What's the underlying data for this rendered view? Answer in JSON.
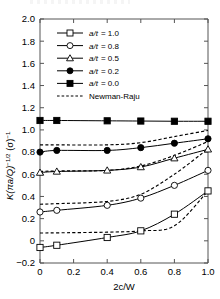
{
  "chart_data": {
    "type": "line",
    "title": "",
    "xlabel": "2c/W",
    "ylabel": "K(πa/Q)^-1/2 (σ)^-1",
    "xlim": [
      0,
      1.0
    ],
    "ylim": [
      -0.2,
      2.0
    ],
    "xticks": [
      "0",
      "0.2",
      "0.4",
      "0.6",
      "0.8",
      "1.0"
    ],
    "xtick_values": [
      0,
      0.2,
      0.4,
      0.6,
      0.8,
      1.0
    ],
    "yticks": [
      "-0.2",
      "0",
      "0.2",
      "0.4",
      "0.6",
      "0.8",
      "1.0",
      "1.2",
      "1.4",
      "1.6",
      "1.8",
      "2.0"
    ],
    "ytick_values": [
      -0.2,
      0,
      0.2,
      0.4,
      0.6,
      0.8,
      1.0,
      1.2,
      1.4,
      1.6,
      1.8,
      2.0
    ],
    "grid": false,
    "legend_position": "upper-left",
    "x": [
      0,
      0.1,
      0.4,
      0.6,
      0.8,
      1.0
    ],
    "series": [
      {
        "name": "a/t = 1.0",
        "marker": "open-square",
        "line": "solid",
        "values": [
          -0.06,
          -0.04,
          0.03,
          0.09,
          0.24,
          0.45
        ]
      },
      {
        "name": "a/t = 0.8",
        "marker": "open-circle",
        "line": "solid",
        "values": [
          0.26,
          0.275,
          0.32,
          0.385,
          0.5,
          0.635
        ]
      },
      {
        "name": "a/t = 0.5",
        "marker": "open-triangle",
        "line": "solid",
        "values": [
          0.615,
          0.625,
          0.635,
          0.665,
          0.745,
          0.825
        ]
      },
      {
        "name": "a/t = 0.2",
        "marker": "filled-circle",
        "line": "solid",
        "values": [
          0.8,
          0.815,
          0.815,
          0.84,
          0.88,
          0.92
        ]
      },
      {
        "name": "a/t = 0.0",
        "marker": "filled-square",
        "line": "solid",
        "values": [
          1.085,
          1.085,
          1.082,
          1.08,
          1.078,
          1.078
        ]
      },
      {
        "name": "Newman-Raju (a/t = 1.0)",
        "marker": "none",
        "line": "dashed",
        "values": [
          0.07,
          0.072,
          0.078,
          0.09,
          0.135,
          0.45
        ]
      },
      {
        "name": "Newman-Raju (a/t = 0.8)",
        "marker": "none",
        "line": "dashed",
        "values": [
          0.33,
          0.335,
          0.355,
          0.42,
          0.6,
          0.83
        ]
      },
      {
        "name": "Newman-Raju (a/t = 0.5)",
        "marker": "none",
        "line": "dashed",
        "values": [
          0.625,
          0.63,
          0.635,
          0.675,
          0.77,
          0.895
        ]
      },
      {
        "name": "Newman-Raju (a/t = 0.2)",
        "marker": "none",
        "line": "dashed",
        "values": [
          0.865,
          0.865,
          0.865,
          0.885,
          0.94,
          0.995
        ]
      }
    ]
  },
  "legend": {
    "items": [
      {
        "label_sym": "a/t",
        "label_eq": "= 1.0",
        "marker": "open-square",
        "line": "solid"
      },
      {
        "label_sym": "a/t",
        "label_eq": "= 0.8",
        "marker": "open-circle",
        "line": "solid"
      },
      {
        "label_sym": "a/t",
        "label_eq": "= 0.5",
        "marker": "open-triangle",
        "line": "solid"
      },
      {
        "label_sym": "a/t",
        "label_eq": "= 0.2",
        "marker": "filled-circle",
        "line": "solid"
      },
      {
        "label_sym": "a/t",
        "label_eq": "= 0.0",
        "marker": "filled-square",
        "line": "solid"
      },
      {
        "label_sym": "",
        "label_eq": "Newman-Raju",
        "marker": "none",
        "line": "dashed"
      }
    ]
  },
  "axes": {
    "x_title": "2c/W",
    "y_title_main": "K(πa/Q)",
    "y_title_exp1": "−1/2",
    "y_title_mid": " (σ)",
    "y_title_exp2": "−1",
    "x_tick_labels": [
      "0",
      "0.2",
      "0.4",
      "0.6",
      "0.8",
      "1.0"
    ],
    "y_tick_labels": [
      "2.0",
      "1.8",
      "1.6",
      "1.4",
      "1.2",
      "1.0",
      "0.8",
      "0.6",
      "0.4",
      "0.2",
      "0",
      "−0.2"
    ]
  },
  "colors": {
    "axis": "#555555",
    "line": "#000000",
    "background": "#ffffff"
  }
}
